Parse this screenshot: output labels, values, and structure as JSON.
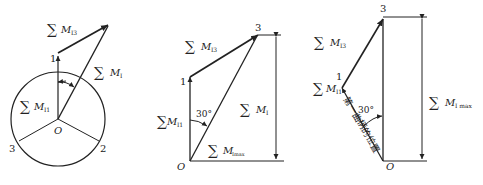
{
  "figure": {
    "panels": [
      {
        "id": "a",
        "points": {
          "p1": "1",
          "p2": "2",
          "p3": "3",
          "origin": "O"
        },
        "labels": {
          "m_i3": {
            "sym": "∑",
            "var": "M",
            "sub": "I3"
          },
          "m_i": {
            "sym": "∑",
            "var": "M",
            "sub": "I"
          },
          "m_i1": {
            "sym": "∑",
            "var": "M",
            "sub": "I1"
          }
        }
      },
      {
        "id": "b",
        "points": {
          "p1": "1",
          "p3": "3",
          "origin": "O"
        },
        "angle": "30°",
        "labels": {
          "m_i3": {
            "sym": "∑",
            "var": "M",
            "sub": "I3"
          },
          "m_i1": {
            "sym": "∑",
            "var": "M",
            "sub": "I1"
          },
          "m_i": {
            "sym": "∑",
            "var": "M",
            "sub": "I"
          },
          "m_imax": {
            "sym": "∑",
            "var": "M",
            "sub": "Imax"
          }
        }
      },
      {
        "id": "c",
        "points": {
          "p1": "1",
          "p3": "3",
          "origin": "O"
        },
        "angle": "30°",
        "crank_note": "第一曲柄的位置",
        "labels": {
          "m_i3": {
            "sym": "∑",
            "var": "M",
            "sub": "I3"
          },
          "m_i1": {
            "sym": "∑",
            "var": "M",
            "sub": "I1"
          },
          "m_imax": {
            "sym": "∑",
            "var": "M",
            "sub": "I max"
          }
        }
      }
    ]
  }
}
